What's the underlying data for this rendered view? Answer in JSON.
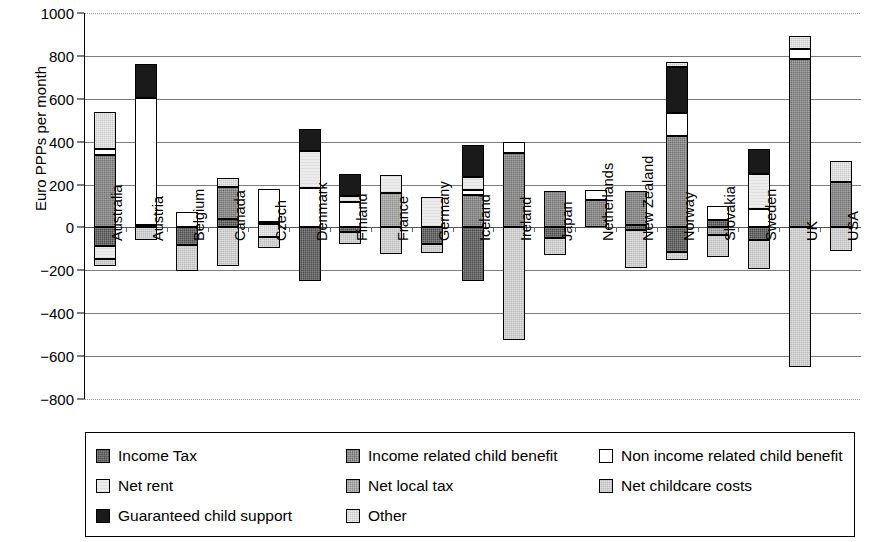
{
  "chart_data": {
    "type": "bar",
    "title": "",
    "subtitle": "",
    "xlabel": "",
    "ylabel": "Euro PPPs per month",
    "ylim": [
      -800,
      1000
    ],
    "ytick_values": [
      1000,
      800,
      600,
      400,
      200,
      0,
      -200,
      -400,
      -600,
      -800
    ],
    "ytick_labels": [
      "1000",
      "800",
      "600",
      "400",
      "200",
      "0",
      "−200",
      "−400",
      "−600",
      "−800"
    ],
    "grid": true,
    "grid_axis": "y",
    "stacked": true,
    "legend_position": "bottom",
    "categories": [
      "Australia",
      "Austria",
      "Belgium",
      "Canada",
      "Czech",
      "Denmark",
      "Finland",
      "France",
      "Germany",
      "Iceland",
      "Ireland",
      "Japan",
      "Netherlands",
      "New Zealand",
      "Norway",
      "Slovakia",
      "Sweden",
      "UK",
      "USA"
    ],
    "series": [
      {
        "name": "Income Tax",
        "color": "#4a4a4a",
        "values": [
          -85,
          0,
          -80,
          -50,
          0,
          -120,
          -60,
          0,
          -75,
          -190,
          0,
          -50,
          0,
          -50,
          -115,
          0,
          -60,
          0,
          -85
        ]
      },
      {
        "name": "Income related child benefit",
        "color": "#6e6e6e",
        "values": [
          345,
          0,
          0,
          185,
          0,
          0,
          0,
          0,
          0,
          150,
          345,
          170,
          130,
          140,
          420,
          0,
          0,
          685,
          210
        ]
      },
      {
        "name": "Non income related child benefit",
        "color": "#ffffff",
        "values": [
          20,
          610,
          70,
          0,
          140,
          190,
          100,
          0,
          0,
          30,
          55,
          0,
          45,
          0,
          110,
          65,
          80,
          45,
          0
        ]
      },
      {
        "name": "Net rent",
        "color": "#ececec",
        "values": [
          0,
          0,
          0,
          0,
          0,
          170,
          0,
          95,
          140,
          60,
          0,
          0,
          0,
          0,
          0,
          0,
          90,
          110,
          0
        ]
      },
      {
        "name": "Net local tax",
        "color": "#8c8c8c",
        "values": [
          0,
          0,
          0,
          0,
          0,
          0,
          0,
          155,
          0,
          0,
          0,
          0,
          0,
          0,
          0,
          -35,
          0,
          0,
          0
        ]
      },
      {
        "name": "Net childcare costs",
        "color": "#bcbcbc",
        "values": [
          -60,
          -60,
          -125,
          -140,
          -95,
          0,
          -85,
          0,
          0,
          0,
          -525,
          -80,
          0,
          -140,
          -35,
          -105,
          -135,
          -650,
          -110
        ]
      },
      {
        "name": "Guaranteed child support",
        "color": "#1a1a1a",
        "values": [
          0,
          155,
          0,
          0,
          0,
          105,
          55,
          0,
          0,
          145,
          0,
          0,
          0,
          0,
          115,
          0,
          115,
          0,
          0
        ]
      },
      {
        "name": "Other",
        "color": "#c9c9c9",
        "values": [
          175,
          0,
          0,
          50,
          40,
          0,
          0,
          0,
          0,
          0,
          0,
          0,
          0,
          0,
          20,
          35,
          90,
          60,
          100
        ]
      }
    ],
    "bars": [
      {
        "category": "Australia",
        "positive": [
          {
            "series": "Income related child benefit",
            "from": 0,
            "to": 340
          },
          {
            "series": "Non income related child benefit",
            "from": 340,
            "to": 365
          },
          {
            "series": "Other",
            "from": 365,
            "to": 540
          }
        ],
        "negative": [
          {
            "series": "Income Tax",
            "from": 0,
            "to": -85
          },
          {
            "series": "Net rent",
            "from": -85,
            "to": -145
          },
          {
            "series": "Net childcare costs",
            "from": -145,
            "to": -180
          }
        ]
      },
      {
        "category": "Austria",
        "positive": [
          {
            "series": "Non income related child benefit",
            "from": 10,
            "to": 605
          },
          {
            "series": "Guaranteed child support",
            "from": 605,
            "to": 760
          }
        ],
        "negative": [
          {
            "series": "Income Tax",
            "from": 10,
            "to": 0
          },
          {
            "series": "Net childcare costs",
            "from": 0,
            "to": -60
          }
        ]
      },
      {
        "category": "Belgium",
        "positive": [
          {
            "series": "Non income related child benefit",
            "from": 0,
            "to": 70
          }
        ],
        "negative": [
          {
            "series": "Income Tax",
            "from": 0,
            "to": -80
          },
          {
            "series": "Net childcare costs",
            "from": -80,
            "to": -205
          }
        ]
      },
      {
        "category": "Canada",
        "positive": [
          {
            "series": "Income related child benefit",
            "from": 40,
            "to": 190
          },
          {
            "series": "Other",
            "from": 190,
            "to": 230
          }
        ],
        "negative": [
          {
            "series": "Income Tax",
            "from": 40,
            "to": 0
          },
          {
            "series": "Net childcare costs",
            "from": 0,
            "to": -180
          }
        ]
      },
      {
        "category": "Czech",
        "positive": [
          {
            "series": "Non income related child benefit",
            "from": 25,
            "to": 180
          }
        ],
        "negative": [
          {
            "series": "Income Tax",
            "from": 25,
            "to": 15
          },
          {
            "series": "Other",
            "from": 15,
            "to": -45
          },
          {
            "series": "Net childcare costs",
            "from": -45,
            "to": -95
          }
        ]
      },
      {
        "category": "Denmark",
        "positive": [
          {
            "series": "Non income related child benefit",
            "from": 0,
            "to": 185
          },
          {
            "series": "Net rent",
            "from": 185,
            "to": 355
          },
          {
            "series": "Guaranteed child support",
            "from": 355,
            "to": 460
          }
        ],
        "negative": [
          {
            "series": "Income Tax",
            "from": 0,
            "to": -250
          }
        ]
      },
      {
        "category": "Finland",
        "positive": [
          {
            "series": "Non income related child benefit",
            "from": 0,
            "to": 120
          },
          {
            "series": "Net rent",
            "from": 120,
            "to": 145
          },
          {
            "series": "Guaranteed child support",
            "from": 145,
            "to": 250
          }
        ],
        "negative": [
          {
            "series": "Income Tax",
            "from": 0,
            "to": -20
          },
          {
            "series": "Net childcare costs",
            "from": -20,
            "to": -75
          }
        ]
      },
      {
        "category": "France",
        "positive": [
          {
            "series": "Net local tax",
            "from": 0,
            "to": 160
          },
          {
            "series": "Net rent",
            "from": 160,
            "to": 245
          }
        ],
        "negative": [
          {
            "series": "Net childcare costs",
            "from": 0,
            "to": -125
          }
        ]
      },
      {
        "category": "Germany",
        "positive": [
          {
            "series": "Net rent",
            "from": 0,
            "to": 140
          }
        ],
        "negative": [
          {
            "series": "Income Tax",
            "from": 0,
            "to": -75
          },
          {
            "series": "Net childcare costs",
            "from": -75,
            "to": -120
          }
        ]
      },
      {
        "category": "Iceland",
        "positive": [
          {
            "series": "Income related child benefit",
            "from": 0,
            "to": 150
          },
          {
            "series": "Non income related child benefit",
            "from": 150,
            "to": 175
          },
          {
            "series": "Net rent",
            "from": 175,
            "to": 235
          },
          {
            "series": "Guaranteed child support",
            "from": 235,
            "to": 385
          }
        ],
        "negative": [
          {
            "series": "Income Tax",
            "from": 0,
            "to": -250
          }
        ]
      },
      {
        "category": "Ireland",
        "positive": [
          {
            "series": "Income related child benefit",
            "from": 0,
            "to": 345
          },
          {
            "series": "Non income related child benefit",
            "from": 345,
            "to": 400
          }
        ],
        "negative": [
          {
            "series": "Net childcare costs",
            "from": 0,
            "to": -525
          }
        ]
      },
      {
        "category": "Japan",
        "positive": [
          {
            "series": "Income related child benefit",
            "from": 0,
            "to": 170
          }
        ],
        "negative": [
          {
            "series": "Income Tax",
            "from": 0,
            "to": -50
          },
          {
            "series": "Net childcare costs",
            "from": -50,
            "to": -130
          }
        ]
      },
      {
        "category": "Netherlands",
        "positive": [
          {
            "series": "Income related child benefit",
            "from": 0,
            "to": 130
          },
          {
            "series": "Non income related child benefit",
            "from": 130,
            "to": 175
          }
        ],
        "negative": []
      },
      {
        "category": "New Zealand",
        "positive": [
          {
            "series": "Income related child benefit",
            "from": 10,
            "to": 170
          }
        ],
        "negative": [
          {
            "series": "Income Tax",
            "from": 10,
            "to": -10
          },
          {
            "series": "Net childcare costs",
            "from": -10,
            "to": -190
          }
        ]
      },
      {
        "category": "Norway",
        "positive": [
          {
            "series": "Income related child benefit",
            "from": 0,
            "to": 425
          },
          {
            "series": "Non income related child benefit",
            "from": 425,
            "to": 535
          },
          {
            "series": "Guaranteed child support",
            "from": 535,
            "to": 750
          },
          {
            "series": "Other",
            "from": 750,
            "to": 770
          }
        ],
        "negative": [
          {
            "series": "Income Tax",
            "from": 0,
            "to": -115
          },
          {
            "series": "Net childcare costs",
            "from": -115,
            "to": -150
          }
        ]
      },
      {
        "category": "Slovakia",
        "positive": [
          {
            "series": "Non income related child benefit",
            "from": 35,
            "to": 100
          }
        ],
        "negative": [
          {
            "series": "Income Tax",
            "from": 35,
            "to": 0
          },
          {
            "series": "Net local tax",
            "from": 0,
            "to": -35
          },
          {
            "series": "Net childcare costs",
            "from": -35,
            "to": -140
          }
        ]
      },
      {
        "category": "Sweden",
        "positive": [
          {
            "series": "Non income related child benefit",
            "from": 0,
            "to": 85
          },
          {
            "series": "Net rent",
            "from": 85,
            "to": 250
          },
          {
            "series": "Guaranteed child support",
            "from": 250,
            "to": 365
          }
        ],
        "negative": [
          {
            "series": "Income Tax",
            "from": 0,
            "to": -60
          },
          {
            "series": "Net childcare costs",
            "from": -60,
            "to": -195
          }
        ]
      },
      {
        "category": "UK",
        "positive": [
          {
            "series": "Income related child benefit",
            "from": 0,
            "to": 785
          },
          {
            "series": "Non income related child benefit",
            "from": 785,
            "to": 830
          },
          {
            "series": "Other",
            "from": 830,
            "to": 895
          }
        ],
        "negative": [
          {
            "series": "Net childcare costs",
            "from": 0,
            "to": -650
          }
        ]
      },
      {
        "category": "USA",
        "positive": [
          {
            "series": "Income related child benefit",
            "from": 0,
            "to": 210
          },
          {
            "series": "Other",
            "from": 210,
            "to": 310
          }
        ],
        "negative": [
          {
            "series": "Net childcare costs",
            "from": 0,
            "to": -110
          }
        ]
      }
    ]
  },
  "legend": {
    "items": [
      {
        "label": "Income Tax",
        "fill": "f-income-tax",
        "icon": "legend-swatch-income-tax"
      },
      {
        "label": "Income related child benefit",
        "fill": "f-income-related",
        "icon": "legend-swatch-income-related-child-benefit"
      },
      {
        "label": "Non income related child benefit",
        "fill": "f-non-income-related",
        "icon": "legend-swatch-non-income-related-child-benefit"
      },
      {
        "label": "Net rent",
        "fill": "f-net-rent",
        "icon": "legend-swatch-net-rent"
      },
      {
        "label": "Net local tax",
        "fill": "f-net-local-tax",
        "icon": "legend-swatch-net-local-tax"
      },
      {
        "label": "Net childcare costs",
        "fill": "f-net-childcare",
        "icon": "legend-swatch-net-childcare-costs"
      },
      {
        "label": "Guaranteed child support",
        "fill": "f-guaranteed",
        "icon": "legend-swatch-guaranteed-child-support"
      },
      {
        "label": "Other",
        "fill": "f-other",
        "icon": "legend-swatch-other"
      }
    ]
  }
}
